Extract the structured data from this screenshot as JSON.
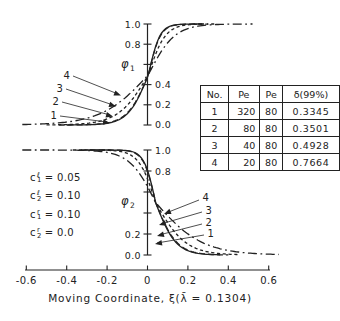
{
  "colors": {
    "background": "#ffffff",
    "ink": "#222222"
  },
  "table": {
    "headers": [
      "No.",
      "Pe",
      "Pe",
      "δ(99%)"
    ],
    "rows": [
      [
        "1",
        "320",
        "80",
        "0.3345"
      ],
      [
        "2",
        "80",
        "80",
        "0.3501"
      ],
      [
        "3",
        "40",
        "80",
        "0.4928"
      ],
      [
        "4",
        "20",
        "80",
        "0.7664"
      ]
    ]
  },
  "annotations": [
    {
      "base": "c",
      "sub": "1",
      "sup": "ℓ",
      "rhs": "= 0.05"
    },
    {
      "base": "c",
      "sub": "2",
      "sup": "ℓ",
      "rhs": "= 0.10"
    },
    {
      "base": "c",
      "sub": "1",
      "sup": "r",
      "rhs": "= 0.10"
    },
    {
      "base": "c",
      "sub": "2",
      "sup": "r",
      "rhs": "= 0.0"
    }
  ],
  "chart_data": [
    {
      "type": "line",
      "title": "",
      "ylabel": "φ1",
      "ylabel_symbol": "φ",
      "ylabel_sub": "1",
      "xlabel": "Moving Coordinate, ξ(λ̄ = 0.1304)",
      "direction": "rising",
      "xlim": [
        -0.6,
        0.6
      ],
      "ylim": [
        0,
        1
      ],
      "grid": false,
      "x_ticks": [
        -0.6,
        -0.4,
        -0.2,
        0,
        0.2,
        0.4,
        0.6
      ],
      "y_ticks": [
        0,
        0.2,
        0.4,
        0.6,
        0.8,
        1.0
      ],
      "y_tick_labels": {
        "left": [
          "1.0",
          "0.8"
        ],
        "right": [
          "0.4",
          "0.2",
          "0.0"
        ]
      },
      "crossing_x": 0.005,
      "tail_skew": {
        "left": 0.72,
        "right": 1.3
      },
      "series": [
        {
          "label": "1",
          "Pe_1": 320,
          "Pe_2": 80,
          "delta_99": 0.3345,
          "line_style": "solid",
          "x_range": [
            -0.4,
            0.27
          ]
        },
        {
          "label": "2",
          "Pe_1": 80,
          "Pe_2": 80,
          "delta_99": 0.3501,
          "line_style": "dash",
          "x_range": [
            -0.44,
            0.3
          ]
        },
        {
          "label": "3",
          "Pe_1": 40,
          "Pe_2": 80,
          "delta_99": 0.4928,
          "line_style": "shortdash",
          "x_range": [
            -0.5,
            0.34
          ]
        },
        {
          "label": "4",
          "Pe_1": 20,
          "Pe_2": 80,
          "delta_99": 0.7664,
          "line_style": "dashdot",
          "x_range": [
            -0.62,
            0.52
          ]
        }
      ]
    },
    {
      "type": "line",
      "title": "",
      "ylabel": "φ2",
      "ylabel_symbol": "φ",
      "ylabel_sub": "2",
      "xlabel": "Moving Coordinate, ξ(λ̄ = 0.1304)",
      "direction": "falling",
      "xlim": [
        -0.6,
        0.6
      ],
      "ylim": [
        0,
        1
      ],
      "grid": false,
      "x_ticks": [
        -0.6,
        -0.4,
        -0.2,
        0,
        0.2,
        0.4,
        0.6
      ],
      "y_ticks": [
        0,
        0.2,
        0.4,
        0.6,
        0.8,
        1.0
      ],
      "y_tick_labels": {
        "right": [
          "1.0",
          "0.8"
        ],
        "left": [
          "0.2",
          "0.0"
        ]
      },
      "crossing_x": 0.04,
      "tail_skew": {
        "left": 1.3,
        "right": 0.72
      },
      "series": [
        {
          "label": "1",
          "Pe_1": 320,
          "Pe_2": 80,
          "delta_99": 0.3345,
          "line_style": "solid",
          "x_range": [
            -0.3,
            0.36
          ]
        },
        {
          "label": "2",
          "Pe_1": 80,
          "Pe_2": 80,
          "delta_99": 0.3501,
          "line_style": "dash",
          "x_range": [
            -0.33,
            0.4
          ]
        },
        {
          "label": "3",
          "Pe_1": 40,
          "Pe_2": 80,
          "delta_99": 0.4928,
          "line_style": "shortdash",
          "x_range": [
            -0.37,
            0.45
          ]
        },
        {
          "label": "4",
          "Pe_1": 20,
          "Pe_2": 80,
          "delta_99": 0.7664,
          "line_style": "dashdot",
          "x_range": [
            -0.62,
            0.655
          ]
        }
      ]
    }
  ]
}
